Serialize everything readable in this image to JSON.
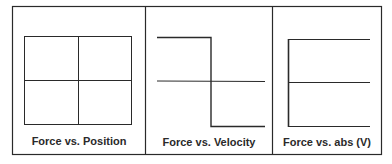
{
  "figure": {
    "panels": [
      {
        "id": "force-vs-position",
        "caption": "Force vs. Position",
        "shape": "quadrant grid (empty rectangle with centered axes cross)"
      },
      {
        "id": "force-vs-velocity",
        "caption": "Force vs. Velocity",
        "shape": "step function: high for negative velocity, drops to low at zero velocity"
      },
      {
        "id": "force-vs-abs-v",
        "caption": "Force vs. abs (V)",
        "shape": "E-shaped: vertical axis at left with three horizontal lines (top, middle, bottom)"
      }
    ],
    "colors": {
      "line": "#2a2a2a",
      "background": "#ffffff"
    }
  }
}
